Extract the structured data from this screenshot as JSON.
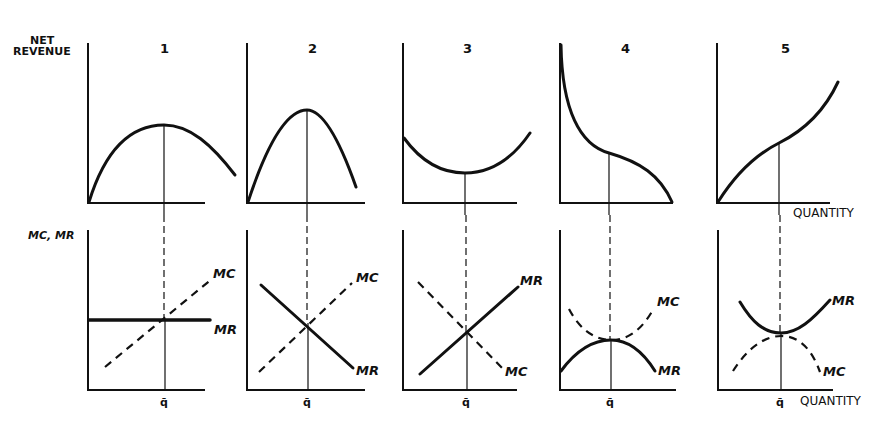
{
  "figure": {
    "top_ylabel": [
      "NET",
      "REVENUE"
    ],
    "bottom_ylabel": "MC, MR",
    "xlabel": "QUANTITY",
    "qbar_label": "q̄",
    "panels": [
      {
        "number": "1",
        "top_curve": "concave, max at q̄",
        "mc_label": "MC",
        "mr_label": "MR",
        "mr_shape": "horizontal",
        "mc_shape": "upward sloping"
      },
      {
        "number": "2",
        "top_curve": "concave, max at q̄",
        "mc_label": "MC",
        "mr_label": "MR",
        "mr_shape": "downward sloping",
        "mc_shape": "upward sloping"
      },
      {
        "number": "3",
        "top_curve": "convex, min at q̄",
        "mc_label": "MC",
        "mr_label": "MR",
        "mr_shape": "upward sloping",
        "mc_shape": "downward sloping"
      },
      {
        "number": "4",
        "top_curve": "decreasing, inflection at q̄",
        "mc_label": "MC",
        "mr_label": "MR",
        "mr_shape": "hump, max at q̄",
        "mc_shape": "U, min at q̄"
      },
      {
        "number": "5",
        "top_curve": "increasing, inflection at q̄",
        "mc_label": "MC",
        "mr_label": "MR",
        "mr_shape": "U, min at q̄",
        "mc_shape": "hump, max at q̄"
      }
    ]
  }
}
